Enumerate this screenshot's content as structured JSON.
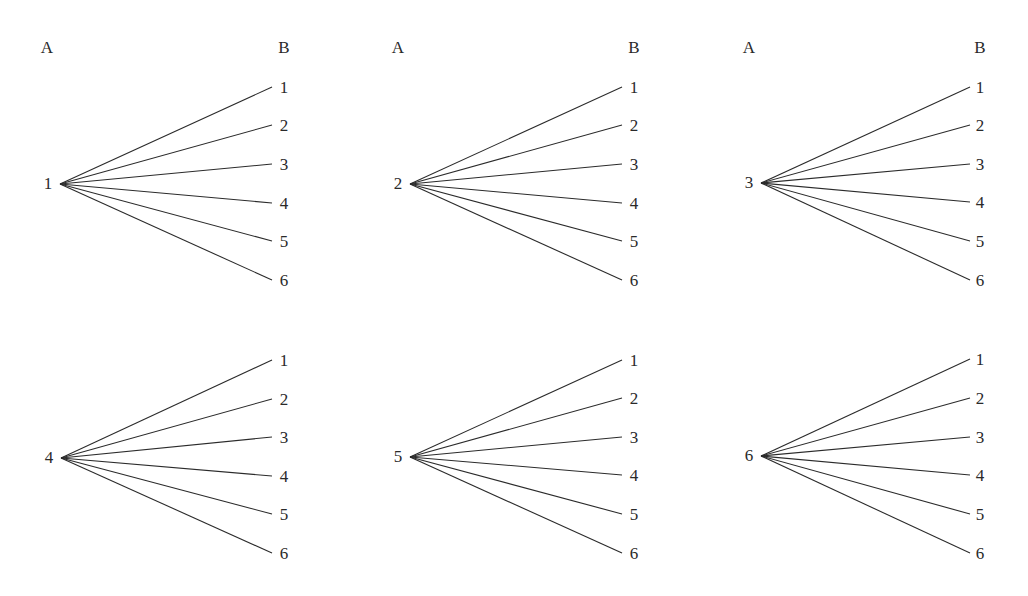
{
  "diagram": {
    "title": "",
    "column_headers": {
      "left": "A",
      "right": "B"
    },
    "leaf_labels": [
      "1",
      "2",
      "3",
      "4",
      "5",
      "6"
    ],
    "trees": [
      {
        "root_label": "1",
        "root": [
          60,
          184
        ],
        "end_x": 272,
        "leaf_ys": [
          87,
          125,
          164,
          203,
          241,
          280
        ],
        "leaf_label_x": 284,
        "header_y": 48,
        "header_a_x": 47,
        "header_b_x": 284,
        "root_label_x": 48
      },
      {
        "root_label": "2",
        "root": [
          410,
          184
        ],
        "end_x": 622,
        "leaf_ys": [
          87,
          125,
          164,
          203,
          241,
          280
        ],
        "leaf_label_x": 634,
        "header_y": 48,
        "header_a_x": 398,
        "header_b_x": 634,
        "root_label_x": 398
      },
      {
        "root_label": "3",
        "root": [
          761,
          183
        ],
        "end_x": 970,
        "leaf_ys": [
          87,
          125,
          164,
          202,
          241,
          280
        ],
        "leaf_label_x": 980,
        "header_y": 48,
        "header_a_x": 749,
        "header_b_x": 980,
        "root_label_x": 749
      },
      {
        "root_label": "4",
        "root": [
          61,
          458
        ],
        "end_x": 272,
        "leaf_ys": [
          360,
          399,
          437,
          476,
          514,
          553
        ],
        "leaf_label_x": 284,
        "root_label_x": 49
      },
      {
        "root_label": "5",
        "root": [
          410,
          457
        ],
        "end_x": 622,
        "leaf_ys": [
          360,
          398,
          437,
          475,
          514,
          553
        ],
        "leaf_label_x": 634,
        "root_label_x": 398
      },
      {
        "root_label": "6",
        "root": [
          761,
          456
        ],
        "end_x": 970,
        "leaf_ys": [
          359,
          398,
          437,
          475,
          514,
          553
        ],
        "leaf_label_x": 980,
        "root_label_x": 749
      }
    ]
  },
  "colors": {
    "line": "#2b2b2b",
    "text": "#2a2a2a",
    "background": "#ffffff"
  }
}
